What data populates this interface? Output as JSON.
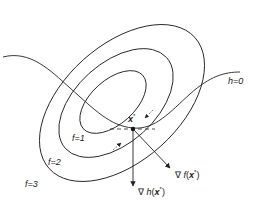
{
  "diagram": {
    "contours": [
      {
        "label": "f=1",
        "level": 1
      },
      {
        "label": "f=2",
        "level": 2
      },
      {
        "label": "f=3",
        "level": 3
      }
    ],
    "constraint": {
      "label": "h=0"
    },
    "point": {
      "label": "x*",
      "label_main": "x",
      "label_sup": "*"
    },
    "vectors": [
      {
        "name": "grad-f",
        "prefix": "∇",
        "func": "f",
        "arg": "x",
        "sup": "*"
      },
      {
        "name": "grad-h",
        "prefix": "∇",
        "func": "h",
        "arg": "x",
        "sup": "*"
      }
    ],
    "colors": {
      "stroke": "#222222",
      "background": "#ffffff"
    }
  }
}
